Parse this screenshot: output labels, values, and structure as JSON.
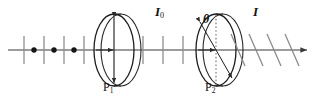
{
  "figure": {
    "width": 321,
    "height": 101,
    "background_color": "#ffffff",
    "stroke_color": "#3a3a3a",
    "ink_color": "#111111",
    "tick_color": "#8a8a8a"
  },
  "labels": {
    "incident_intensity": "I",
    "incident_intensity_sub": "0",
    "transmitted_intensity": "I",
    "angle": "θ",
    "polarizer_1": "P",
    "polarizer_1_sub": "1",
    "polarizer_2": "P",
    "polarizer_2_sub": "2"
  },
  "axis": {
    "name": "optical-axis",
    "y": 50,
    "x_start": 8,
    "x_end": 313,
    "arrow_at_end": true
  },
  "unpolarized_beam": {
    "description": "unpolarized light: alternating vertical bars and dots",
    "bar_x": [
      24,
      44,
      64,
      84
    ],
    "bar_half_height": 14,
    "dot_x": [
      34,
      54,
      74
    ],
    "dot_radius": 2.6
  },
  "polarized_beam_mid": {
    "description": "linearly polarized (vertical) light between P1 and P2",
    "bar_x": [
      143,
      163,
      183
    ],
    "bar_half_height": 14
  },
  "polarized_beam_right": {
    "description": "linearly polarized light tilted at angle theta after P2",
    "stroke_x": [
      238,
      256,
      274,
      292
    ],
    "tilt_degrees": 60,
    "stroke_half_length": 16
  },
  "polarizer_1": {
    "name": "P1",
    "center_x": 114,
    "center_y": 50,
    "rx": 20,
    "ry": 36,
    "transmission_axis": "vertical",
    "double_arrow": true,
    "thickness_offset": 7
  },
  "polarizer_2": {
    "name": "P2",
    "center_x": 216,
    "center_y": 50,
    "rx": 20,
    "ry": 36,
    "transmission_axis": "tilted",
    "tilt_degrees": 60,
    "double_arrow": true,
    "reference_line": "dotted vertical",
    "thickness_offset": 7
  }
}
